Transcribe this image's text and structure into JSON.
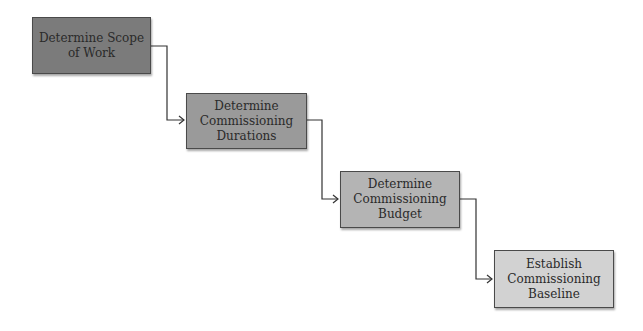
{
  "diagram": {
    "type": "staircase-flow",
    "steps": [
      {
        "label": "Determine Scope\nof Work",
        "fill": "#7b7b7b"
      },
      {
        "label": "Determine\nCommissioning\nDurations",
        "fill": "#9a9a9a"
      },
      {
        "label": "Determine\nCommissioning\nBudget",
        "fill": "#b4b4b4"
      },
      {
        "label": "Establish\nCommissioning\nBaseline",
        "fill": "#d2d2d2"
      }
    ],
    "connector_color": "#333333"
  }
}
